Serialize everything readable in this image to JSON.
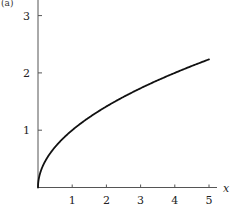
{
  "chart_data": {
    "type": "line",
    "title": "",
    "panel_label": "(a)",
    "xlabel": "x",
    "ylabel": "",
    "xlim": [
      0,
      5.25
    ],
    "ylim": [
      0,
      3.2
    ],
    "x_ticks": [
      1,
      2,
      3,
      4,
      5
    ],
    "y_ticks": [
      1,
      2,
      3
    ],
    "grid": false,
    "legend": null,
    "series": [
      {
        "name": "y = sqrt(x)",
        "function": "sqrt(x)",
        "x": [
          0,
          0.05,
          0.1,
          0.25,
          0.5,
          0.75,
          1,
          1.5,
          2,
          2.5,
          3,
          3.5,
          4,
          4.5,
          5
        ],
        "values": [
          0,
          0.224,
          0.316,
          0.5,
          0.707,
          0.866,
          1,
          1.225,
          1.414,
          1.581,
          1.732,
          1.871,
          2,
          2.121,
          2.236
        ],
        "color": "#111111"
      }
    ]
  }
}
